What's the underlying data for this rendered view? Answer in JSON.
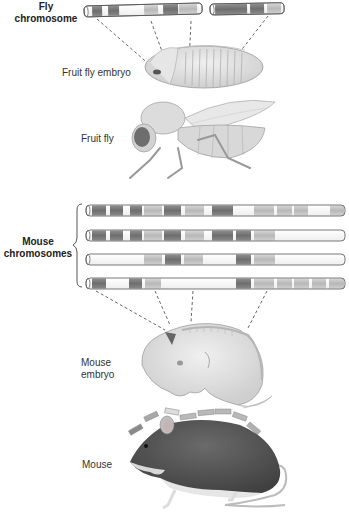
{
  "labels": {
    "fly_chromosome": "Fly\nchromosome",
    "fly_chromosome_line1": "Fly",
    "fly_chromosome_line2": "chromosome",
    "fruit_fly_embryo": "Fruit fly embryo",
    "fruit_fly": "Fruit fly",
    "mouse_chromosomes_line1": "Mouse",
    "mouse_chromosomes_line2": "chromosomes",
    "mouse_embryo_line1": "Mouse",
    "mouse_embryo_line2": "embryo",
    "mouse": "Mouse"
  },
  "colors": {
    "dark_band": "#7a7a7a",
    "medium_band": "#9a9a9a",
    "light_band": "#c4c4c4",
    "white_band": "#ffffff",
    "outline": "#555555",
    "dash": "#555555"
  },
  "fly_chromosomes": [
    {
      "x": 84,
      "y": 7,
      "w": 118,
      "bands": [
        "white",
        "dark",
        "white",
        "dark",
        "white",
        "white",
        "light",
        "white",
        "dark",
        "light"
      ]
    },
    {
      "x": 210,
      "y": 7,
      "w": 72,
      "bands": [
        "dark",
        "white",
        "dark",
        "light"
      ]
    }
  ],
  "mouse_chromosomes": [
    {
      "y": 204,
      "bands": [
        "dark",
        "white",
        "dark",
        "white",
        "dark",
        "light",
        "dark",
        "light",
        "white",
        "dark",
        "white",
        "light",
        "light",
        "light",
        "white",
        "light"
      ]
    },
    {
      "y": 229,
      "bands": [
        "dark",
        "white",
        "dark",
        "white",
        "dark",
        "light",
        "dark",
        "light",
        "white",
        "dark",
        "dark",
        "light",
        "white"
      ]
    },
    {
      "y": 253,
      "bands": [
        "white",
        "light",
        "dark",
        "light",
        "white",
        "dark",
        "light",
        "white"
      ]
    },
    {
      "y": 277,
      "bands": [
        "dark",
        "white",
        "dark",
        "light",
        "white",
        "dark",
        "light",
        "light",
        "light",
        "light",
        "light",
        "light"
      ]
    }
  ],
  "organisms": [
    "Fruit fly embryo",
    "Fruit fly",
    "Mouse embryo",
    "Mouse"
  ]
}
